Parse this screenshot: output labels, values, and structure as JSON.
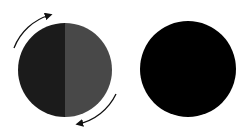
{
  "diagram": {
    "type": "two-circle rotation illustration",
    "left_circle": {
      "center": [
        65,
        70
      ],
      "radius": 47,
      "left_half_color": "#1b1b1b",
      "right_half_color": "#484848",
      "description": "circle split vertically into dark and gray halves, rotating"
    },
    "rotation_arrows": [
      {
        "name": "upper-left-arc-arrow",
        "direction": "clockwise",
        "color": "#111111"
      },
      {
        "name": "lower-right-arc-arrow",
        "direction": "clockwise",
        "color": "#111111"
      }
    ],
    "right_circle": {
      "center": [
        188,
        69
      ],
      "radius": 48,
      "color": "#000000",
      "description": "solid black circle"
    }
  }
}
